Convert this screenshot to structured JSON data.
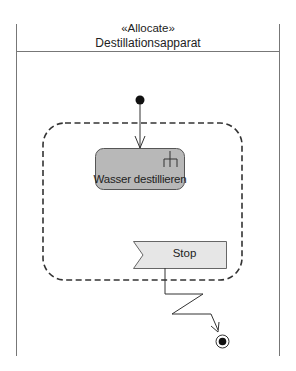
{
  "partition": {
    "stereotype": "«Allocate»",
    "name": "Destillationsapparat"
  },
  "interruptible_region": {
    "style": "dashed"
  },
  "action": {
    "label": "Wasser destillieren",
    "icon": "call-behavior-rake-icon",
    "fill": "#b8b8b8"
  },
  "accept_event": {
    "label": "Stop",
    "fill": "#e6e6e6"
  },
  "nodes": {
    "initial": "initial-node",
    "final": "activity-final-node"
  },
  "edges": [
    {
      "from": "initial-node",
      "to": "Wasser destillieren",
      "type": "control-flow"
    },
    {
      "from": "Stop",
      "to": "activity-final-node",
      "type": "interrupting-edge"
    }
  ]
}
